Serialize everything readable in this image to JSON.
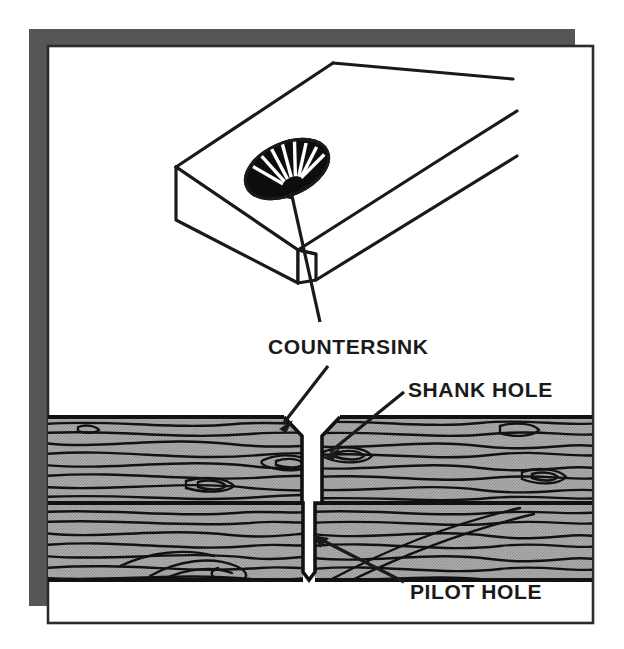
{
  "figure": {
    "labels": [
      {
        "id": "countersink",
        "text": "COUNTERSINK"
      },
      {
        "id": "shank-hole",
        "text": "SHANK HOLE"
      },
      {
        "id": "pilot-hole",
        "text": "PILOT HOLE"
      }
    ],
    "colors": {
      "ink": "#1a1a1a",
      "paper": "#ffffff",
      "shadow": "#565656",
      "wood_fill": "#a3a3a3",
      "grain": "#111111",
      "border": "#2b2b2b"
    },
    "parts": {
      "board_top_view": "isometric board with countersunk hole",
      "cross_section": "two stacked boards in section showing drilled hole",
      "countersink_cone": "black conical recess with radial rib highlights"
    }
  }
}
